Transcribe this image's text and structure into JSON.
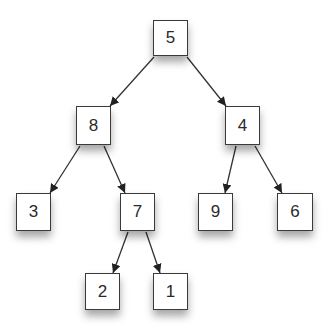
{
  "diagram": {
    "type": "binary-tree",
    "colors": {
      "background": "#ffffff",
      "node_fill": "#ffffff",
      "node_border": "#3a3a3a",
      "edge": "#333333",
      "text": "#2a2a2a"
    },
    "nodes": [
      {
        "id": "n5",
        "label": "5",
        "x": 153,
        "y": 20,
        "w": 35,
        "h": 36
      },
      {
        "id": "n8",
        "label": "8",
        "x": 76,
        "y": 106,
        "w": 35,
        "h": 39
      },
      {
        "id": "n4",
        "label": "4",
        "x": 225,
        "y": 106,
        "w": 35,
        "h": 39
      },
      {
        "id": "n3",
        "label": "3",
        "x": 16,
        "y": 193,
        "w": 35,
        "h": 38
      },
      {
        "id": "n7",
        "label": "7",
        "x": 120,
        "y": 193,
        "w": 35,
        "h": 38
      },
      {
        "id": "n9",
        "label": "9",
        "x": 198,
        "y": 193,
        "w": 35,
        "h": 38
      },
      {
        "id": "n6",
        "label": "6",
        "x": 277,
        "y": 193,
        "w": 36,
        "h": 38
      },
      {
        "id": "n2",
        "label": "2",
        "x": 85,
        "y": 273,
        "w": 35,
        "h": 37
      },
      {
        "id": "n1",
        "label": "1",
        "x": 153,
        "y": 273,
        "w": 35,
        "h": 37
      }
    ],
    "edges": [
      {
        "from": "5",
        "to": "8",
        "x1": 154,
        "y1": 57,
        "x2": 110,
        "y2": 106
      },
      {
        "from": "5",
        "to": "4",
        "x1": 187,
        "y1": 57,
        "x2": 226,
        "y2": 106
      },
      {
        "from": "8",
        "to": "3",
        "x1": 80,
        "y1": 146,
        "x2": 50,
        "y2": 193
      },
      {
        "from": "8",
        "to": "7",
        "x1": 104,
        "y1": 146,
        "x2": 125,
        "y2": 193
      },
      {
        "from": "4",
        "to": "9",
        "x1": 236,
        "y1": 146,
        "x2": 225,
        "y2": 193
      },
      {
        "from": "4",
        "to": "6",
        "x1": 255,
        "y1": 146,
        "x2": 282,
        "y2": 193
      },
      {
        "from": "7",
        "to": "2",
        "x1": 128,
        "y1": 232,
        "x2": 113,
        "y2": 273
      },
      {
        "from": "7",
        "to": "1",
        "x1": 146,
        "y1": 232,
        "x2": 160,
        "y2": 273
      }
    ]
  }
}
